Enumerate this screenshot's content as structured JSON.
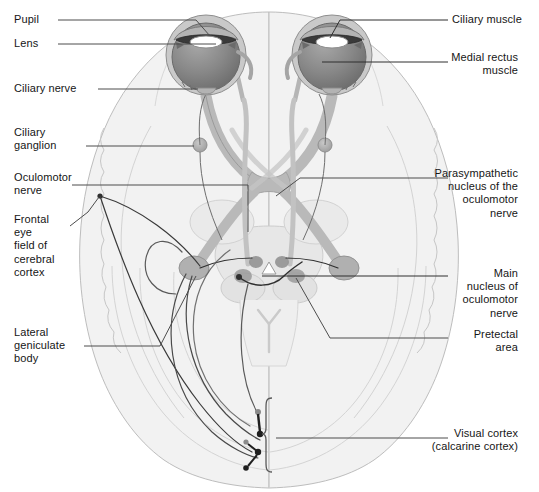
{
  "figure": {
    "kind": "anatomical-diagram"
  },
  "palette": {
    "brain_fill": "#f2f2f2",
    "brain_stroke": "#b8b8b8",
    "brain_inner_fill": "#ececec",
    "nerve_fill": "#b3b3b3",
    "nerve_stroke": "#8c8c8c",
    "eye_sclera": "#cfcfcf",
    "eye_iris_dark": "#5e5e5e",
    "eye_vitreous": "#8a8a8a",
    "lens_white": "#ffffff",
    "leader_line": "#4d4d4d",
    "tract_line": "#3a3a3a",
    "text": "#161616"
  },
  "labels": {
    "left": [
      {
        "id": "pupil",
        "text": "Pupil",
        "x": 14,
        "y": 14
      },
      {
        "id": "lens",
        "text": "Lens",
        "x": 14,
        "y": 38
      },
      {
        "id": "ciliary-nerve",
        "text": "Ciliary nerve",
        "x": 14,
        "y": 83
      },
      {
        "id": "ciliary-ganglion",
        "text": "Ciliary\nganglion",
        "x": 14,
        "y": 127
      },
      {
        "id": "oculomotor-nerve",
        "text": "Oculomotor\nnerve",
        "x": 14,
        "y": 172
      },
      {
        "id": "frontal-eye-field",
        "text": "Frontal\neye\nfield of\ncerebral\ncortex",
        "x": 14,
        "y": 214
      },
      {
        "id": "lateral-geniculate-body",
        "text": "Lateral\ngeniculate\nbody",
        "x": 14,
        "y": 327
      }
    ],
    "right": [
      {
        "id": "ciliary-muscle",
        "text": "Ciliary muscle",
        "x": 452,
        "y": 14,
        "align": "left"
      },
      {
        "id": "medial-rectus-muscle",
        "text": "Medial rectus\nmuscle",
        "x": 380,
        "y": 52,
        "align": "right",
        "width": 138
      },
      {
        "id": "parasympathetic-nucleus",
        "text": "Parasympathetic\nnucleus of the\noculomotor\nnerve",
        "x": 380,
        "y": 168,
        "align": "right",
        "width": 138
      },
      {
        "id": "main-nucleus-oculomotor",
        "text": "Main\nnucleus of\noculomotor\nnerve",
        "x": 380,
        "y": 268,
        "align": "right",
        "width": 138
      },
      {
        "id": "pretectal-area",
        "text": "Pretectal\narea",
        "x": 380,
        "y": 329,
        "align": "right",
        "width": 138
      },
      {
        "id": "visual-cortex",
        "text": "Visual cortex\n(calcarine cortex)",
        "x": 380,
        "y": 428,
        "align": "right",
        "width": 138
      }
    ]
  },
  "structures": [
    {
      "id": "left-eye",
      "name": "Left eyeball"
    },
    {
      "id": "right-eye",
      "name": "Right eyeball"
    },
    {
      "id": "optic-chiasm",
      "name": "Optic chiasm"
    },
    {
      "id": "optic-tract",
      "name": "Optic tract"
    },
    {
      "id": "lateral-geniculate-left",
      "name": "Left lateral geniculate body"
    },
    {
      "id": "lateral-geniculate-right",
      "name": "Right lateral geniculate body"
    },
    {
      "id": "brainstem",
      "name": "Midbrain / brainstem"
    },
    {
      "id": "visual-cortex-bracket",
      "name": "Calcarine cortex bracket"
    }
  ]
}
